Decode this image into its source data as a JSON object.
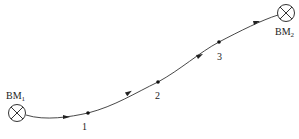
{
  "diagram": {
    "type": "leveling-route",
    "benchmarks": [
      {
        "id": "BM1",
        "base": "BM",
        "sub": "1"
      },
      {
        "id": "BM2",
        "base": "BM",
        "sub": "2"
      }
    ],
    "turning_points": [
      {
        "label": "1"
      },
      {
        "label": "2"
      },
      {
        "label": "3"
      }
    ],
    "line_color": "#333333"
  }
}
